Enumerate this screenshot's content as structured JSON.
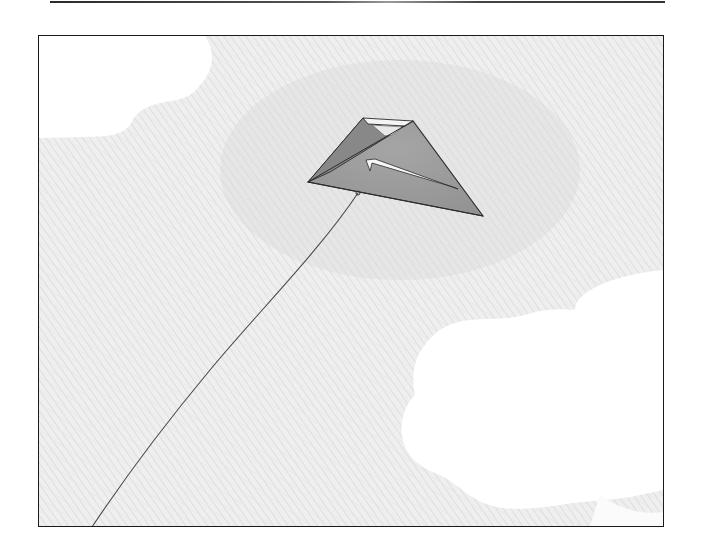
{
  "scene": {
    "description": "Pencil-sketch illustration of a triangular kite flying in a hatched grey sky with white clouds",
    "colors": {
      "sky": "#efefef",
      "sky_hatch": "#dcdcdc",
      "cloud": "#ffffff",
      "kite_fill": "#9c9c9c",
      "kite_fill_dark": "#8a8a8a",
      "kite_highlight": "#f4f4f4",
      "outline": "#2b2b2b",
      "string": "#4a4a4a",
      "frame_border": "#1a1a1a"
    },
    "frame": {
      "x": 38,
      "y": 35,
      "width": 626,
      "height": 492
    },
    "kite": {
      "left_tip": [
        308,
        182
      ],
      "top_left": [
        363,
        118
      ],
      "top_right": [
        413,
        121
      ],
      "right_tip": [
        483,
        216
      ],
      "bridle_point": [
        358,
        193
      ]
    },
    "string": {
      "from": [
        358,
        193
      ],
      "to": [
        92,
        527
      ]
    },
    "clouds": [
      "top-left",
      "bottom-right"
    ]
  }
}
